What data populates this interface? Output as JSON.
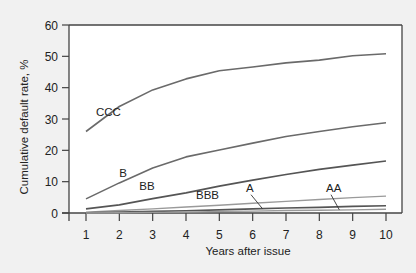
{
  "chart_data": {
    "type": "line",
    "title": "",
    "xlabel": "Years after issue",
    "ylabel": "Cumulative default rate, %",
    "xlim": [
      1,
      10
    ],
    "ylim": [
      0,
      60
    ],
    "x": [
      1,
      2,
      3,
      4,
      5,
      6,
      7,
      8,
      9,
      10
    ],
    "xticks": [
      "1",
      "2",
      "3",
      "4",
      "5",
      "6",
      "7",
      "8",
      "9",
      "10"
    ],
    "yticks": [
      "0",
      "10",
      "20",
      "30",
      "40",
      "50",
      "60"
    ],
    "grid": false,
    "legend": "inline labels",
    "series": [
      {
        "name": "CCC",
        "values": [
          26,
          34,
          39.3,
          42.8,
          45.4,
          46.6,
          47.9,
          48.8,
          50.2,
          50.8
        ]
      },
      {
        "name": "B",
        "values": [
          4.5,
          9.6,
          14.4,
          17.9,
          20.1,
          22.3,
          24.4,
          26.0,
          27.5,
          28.8
        ]
      },
      {
        "name": "BB",
        "values": [
          1.3,
          2.6,
          4.6,
          6.4,
          8.6,
          10.5,
          12.3,
          13.9,
          15.3,
          16.6
        ]
      },
      {
        "name": "BBB",
        "values": [
          0.3,
          0.8,
          1.3,
          1.9,
          2.5,
          3.1,
          3.7,
          4.3,
          4.9,
          5.4
        ]
      },
      {
        "name": "A",
        "values": [
          0.1,
          0.3,
          0.5,
          0.7,
          1.0,
          1.3,
          1.6,
          1.8,
          2.1,
          2.3
        ]
      },
      {
        "name": "AA",
        "values": [
          0.0,
          0.1,
          0.2,
          0.3,
          0.5,
          0.6,
          0.8,
          0.9,
          1.0,
          1.2
        ]
      }
    ],
    "annotations": [
      {
        "text": "CCC",
        "x": 1.3,
        "y": 31
      },
      {
        "text": "B",
        "x": 2.0,
        "y": 11.5
      },
      {
        "text": "BB",
        "x": 2.6,
        "y": 7.5
      },
      {
        "text": "BBB",
        "x": 4.3,
        "y": 4.5
      },
      {
        "text": "A",
        "x": 5.8,
        "y": 6.8,
        "pointer_to": [
          6.3,
          1.3
        ]
      },
      {
        "text": "AA",
        "x": 8.2,
        "y": 6.8,
        "pointer_to": [
          8.6,
          1.0
        ]
      }
    ]
  },
  "colors": {
    "background": "#f1f1f1",
    "plot_bg": "#ffffff",
    "line_dark": "#555555",
    "line_mid": "#6a6a6a",
    "line_light": "#9a9a9a",
    "axis": "#444444"
  }
}
